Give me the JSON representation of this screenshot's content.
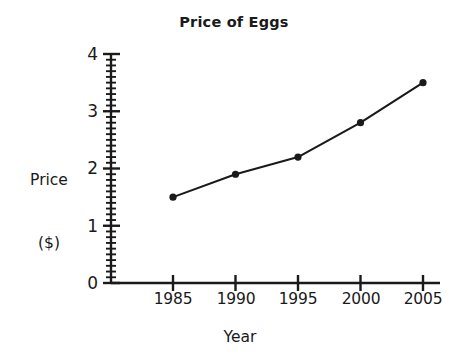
{
  "chart_data": {
    "type": "line",
    "title": "Price of Eggs",
    "xlabel": "Year",
    "ylabel": "Price ($)",
    "ylabel_line1": "Price",
    "ylabel_line2": "($)",
    "categories": [
      "1985",
      "1990",
      "1995",
      "2000",
      "2005"
    ],
    "x": [
      1985,
      1990,
      1995,
      2000,
      2005
    ],
    "values": [
      1.5,
      1.9,
      2.2,
      2.8,
      3.5
    ],
    "series": [
      {
        "name": "Price of Eggs",
        "values": [
          1.5,
          1.9,
          2.2,
          2.8,
          3.5
        ]
      }
    ],
    "xlim": [
      1982.5,
      2006.5
    ],
    "ylim": [
      0,
      4
    ],
    "ytick_labels": [
      "0",
      "1",
      "2",
      "3",
      "4"
    ],
    "yticks": [
      0,
      1,
      2,
      3,
      4
    ],
    "y_minor_tick_step": 0.1,
    "xtick_labels": [
      "1985",
      "1990",
      "1995",
      "2000",
      "2005"
    ],
    "grid": false,
    "legend": false,
    "legend_position": "none",
    "marker": "filled-circle",
    "line_color": "#1a1a1a",
    "marker_color": "#1a1a1a",
    "axis_color": "#1a1a1a",
    "background_color": "#ffffff"
  }
}
